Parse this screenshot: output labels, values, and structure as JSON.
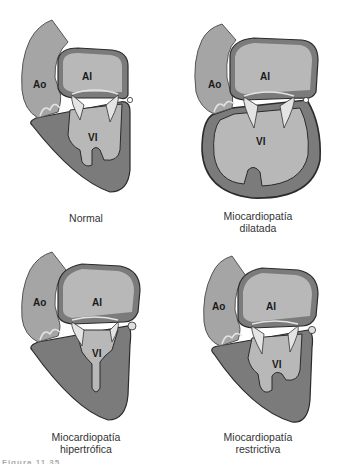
{
  "figure": {
    "caption_partial": "Figura 11.35",
    "colors": {
      "wall": "#7b7b7b",
      "chamber": "#b8b8b8",
      "aorta": "#a5a5a5",
      "valve": "#e4e4e4",
      "outline": "#2b2b2b"
    },
    "panels": [
      {
        "id": "normal",
        "labels": {
          "ao": "Ao",
          "al": "AI",
          "vi": "VI"
        },
        "caption_line1": "Normal",
        "caption_line2": ""
      },
      {
        "id": "dilatada",
        "labels": {
          "ao": "Ao",
          "al": "AI",
          "vi": "VI"
        },
        "caption_line1": "Miocardiopatía",
        "caption_line2": "dilatada"
      },
      {
        "id": "hipertrofica",
        "labels": {
          "ao": "Ao",
          "al": "AI",
          "vi": "VI"
        },
        "caption_line1": "Miocardiopatía",
        "caption_line2": "hipertrófica"
      },
      {
        "id": "restrictiva",
        "labels": {
          "ao": "Ao",
          "al": "AI",
          "vi": "VI"
        },
        "caption_line1": "Miocardiopatía",
        "caption_line2": "restrictiva"
      }
    ]
  }
}
